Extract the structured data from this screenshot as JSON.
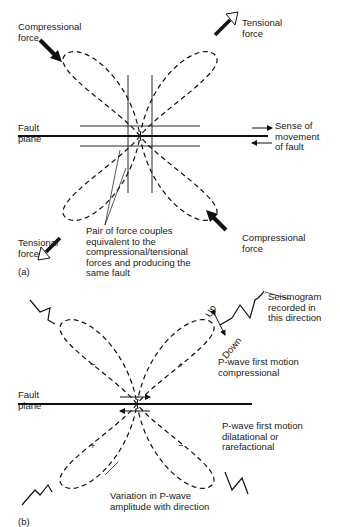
{
  "panel_a": {
    "compressional_top": "Compressional\nforce",
    "tensional_top": "Tensional\nforce",
    "fault_plane": "Fault\nplane",
    "sense_of_movement": "Sense of\nmovement\nof fault",
    "tensional_bottom": "Tensional\nforce",
    "compressional_bottom": "Compressional\nforce",
    "force_couples": "Pair of force couples\nequivalent to the\ncompressional/tensional\nforces and producing the\nsame fault",
    "label": "(a)"
  },
  "panel_b": {
    "up": "Up",
    "down": "Down",
    "seismogram": "Seismogram\nrecorded in\nthis direction",
    "fault_plane": "Fault\nplane",
    "compressional": "P-wave first motion\ncompressional",
    "dilatational": "P-wave first motion\ndilatational or\nrarefactional",
    "variation": "Variation in P-wave\namplitude with direction",
    "signs": {
      "top_left": "−",
      "top_right": "+",
      "bottom_left": "+",
      "bottom_right": "−"
    },
    "label": "(b)"
  }
}
